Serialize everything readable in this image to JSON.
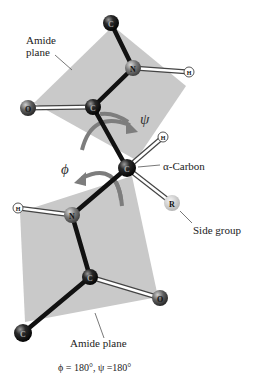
{
  "figure": {
    "labels": {
      "amide_plane_top": [
        "Amide",
        "plane"
      ],
      "amide_plane_bottom": "Amide plane",
      "alpha_carbon": "α-Carbon",
      "side_group": "Side group",
      "psi": "ψ",
      "phi": "ϕ",
      "caption": "ϕ = 180°, ψ =180°"
    },
    "atoms": [
      {
        "id": "c_top",
        "element": "C",
        "x": 111,
        "y": 23,
        "r": 8,
        "color": "#1a1a1a"
      },
      {
        "id": "n_top",
        "element": "N",
        "x": 133,
        "y": 68,
        "r": 8,
        "color": "#7a7a7a"
      },
      {
        "id": "h_top",
        "element": "H",
        "x": 189,
        "y": 72,
        "r": 5,
        "color": "#ffffff"
      },
      {
        "id": "c_carbonyl_top",
        "element": "C",
        "x": 93,
        "y": 107,
        "r": 8,
        "color": "#1a1a1a"
      },
      {
        "id": "o_top",
        "element": "O",
        "x": 28,
        "y": 108,
        "r": 8,
        "color": "#555555"
      },
      {
        "id": "c_alpha",
        "element": "C",
        "x": 127,
        "y": 168,
        "r": 9,
        "color": "#1a1a1a"
      },
      {
        "id": "h_alpha",
        "element": "H",
        "x": 163,
        "y": 137,
        "r": 5,
        "color": "#ffffff"
      },
      {
        "id": "r_side",
        "element": "R",
        "x": 172,
        "y": 203,
        "r": 8,
        "color": "#c8c8c8"
      },
      {
        "id": "n_bottom",
        "element": "N",
        "x": 72,
        "y": 215,
        "r": 8,
        "color": "#7a7a7a"
      },
      {
        "id": "h_bottom",
        "element": "H",
        "x": 18,
        "y": 208,
        "r": 5,
        "color": "#ffffff"
      },
      {
        "id": "c_carbonyl_bottom",
        "element": "C",
        "x": 90,
        "y": 277,
        "r": 8,
        "color": "#1a1a1a"
      },
      {
        "id": "o_bottom",
        "element": "O",
        "x": 160,
        "y": 298,
        "r": 8,
        "color": "#555555"
      },
      {
        "id": "c_bottom",
        "element": "C",
        "x": 23,
        "y": 333,
        "r": 9,
        "color": "#1a1a1a"
      }
    ],
    "bonds": [
      {
        "from": "c_top",
        "to": "n_top",
        "type": "backbone"
      },
      {
        "from": "n_top",
        "to": "h_top",
        "type": "white"
      },
      {
        "from": "n_top",
        "to": "c_carbonyl_top",
        "type": "backbone"
      },
      {
        "from": "c_carbonyl_top",
        "to": "o_top",
        "type": "white"
      },
      {
        "from": "c_carbonyl_top",
        "to": "c_alpha",
        "type": "backbone"
      },
      {
        "from": "c_alpha",
        "to": "h_alpha",
        "type": "white"
      },
      {
        "from": "c_alpha",
        "to": "r_side",
        "type": "white"
      },
      {
        "from": "c_alpha",
        "to": "n_bottom",
        "type": "backbone"
      },
      {
        "from": "n_bottom",
        "to": "h_bottom",
        "type": "white"
      },
      {
        "from": "n_bottom",
        "to": "c_carbonyl_bottom",
        "type": "backbone"
      },
      {
        "from": "c_carbonyl_bottom",
        "to": "o_bottom",
        "type": "white"
      },
      {
        "from": "c_carbonyl_bottom",
        "to": "c_bottom",
        "type": "backbone"
      }
    ],
    "colors": {
      "plane": "#c9c9c9",
      "backbone_bond": "#111111",
      "arrow": "#7d7d7d",
      "text": "#222222"
    }
  }
}
